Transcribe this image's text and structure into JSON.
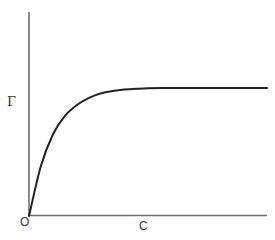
{
  "chart_data": {
    "type": "line",
    "title": "",
    "xlabel": "C",
    "ylabel": "Γ",
    "origin_label": "O",
    "grid": false,
    "legend": null,
    "axis_ticks": false,
    "xlim": [
      0,
      1
    ],
    "ylim": [
      0,
      1
    ],
    "series": [
      {
        "name": "Γ vs C",
        "x": [
          0.0,
          0.05,
          0.1,
          0.15,
          0.2,
          0.25,
          0.3,
          0.35,
          0.4,
          0.45,
          0.5,
          0.6,
          0.7,
          0.8,
          1.0
        ],
        "y": [
          0.0,
          0.32,
          0.52,
          0.64,
          0.71,
          0.755,
          0.785,
          0.8,
          0.81,
          0.815,
          0.818,
          0.82,
          0.82,
          0.82,
          0.82
        ]
      }
    ],
    "colors": {
      "curve": "#222222",
      "axes": "#6e6e6e",
      "background": "#ffffff"
    }
  },
  "labels": {
    "y_axis": "Γ",
    "x_axis": "C",
    "origin": "O"
  }
}
